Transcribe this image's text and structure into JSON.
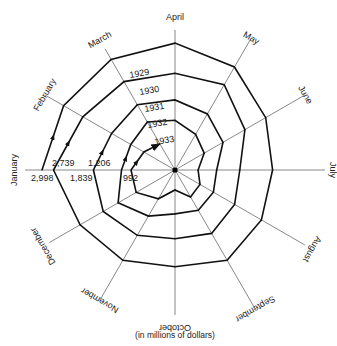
{
  "chart_data": {
    "type": "radar-spiral",
    "title": "",
    "unit_note": "(in millions of dollars)",
    "months": [
      "January",
      "February",
      "March",
      "April",
      "May",
      "June",
      "July",
      "August",
      "September",
      "October",
      "November",
      "December"
    ],
    "series": [
      {
        "name": "1929",
        "values": [
          2998,
          2900,
          2880,
          2860,
          2680,
          2360,
          2200,
          2250,
          2350,
          2180,
          2350,
          2470
        ]
      },
      {
        "name": "1930",
        "values": [
          2739,
          2400,
          2300,
          2180,
          2220,
          1820,
          1460,
          1550,
          1650,
          1550,
          1700,
          1870
        ]
      },
      {
        "name": "1931",
        "values": [
          1839,
          1650,
          1700,
          1580,
          1460,
          1250,
          940,
          1000,
          1050,
          990,
          1200,
          1480
        ]
      },
      {
        "name": "1932",
        "values": [
          1206,
          1150,
          1250,
          1120,
          930,
          760,
          520,
          650,
          700,
          450,
          750,
          1010
        ]
      },
      {
        "name": "1933",
        "values": [
          992,
          810,
          680
        ]
      }
    ],
    "january_labels": [
      {
        "year": "1929",
        "text": "2,998"
      },
      {
        "year": "1930",
        "text": "2,739"
      },
      {
        "year": "1931",
        "text": "1,839"
      },
      {
        "year": "1932",
        "text": "1,206"
      },
      {
        "year": "1933",
        "text": "992"
      }
    ],
    "year_labels": [
      "1929",
      "1930",
      "1931",
      "1932",
      "1933"
    ],
    "rmax_value": 3000,
    "direction": "clockwise, January at left, April at top"
  }
}
